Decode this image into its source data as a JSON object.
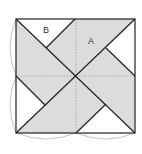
{
  "diagram": {
    "labels": {
      "A": "A",
      "B": "B"
    },
    "colors": {
      "shade": "#dcdcdc",
      "line": "#222222",
      "dashed": "#999999",
      "arc": "#aaaaaa",
      "background": "#ffffff"
    },
    "square": {
      "x": 16,
      "y": 19,
      "size": 119
    }
  }
}
